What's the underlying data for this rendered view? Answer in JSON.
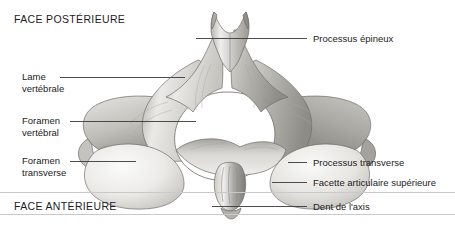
{
  "figure": {
    "type": "anatomical-diagram",
    "language": "fr",
    "orientation_labels": {
      "top": "FACE POSTÉRIEURE",
      "bottom": "FACE ANTÉRIEURE"
    },
    "callouts": [
      {
        "id": "processus-epineux",
        "label": "Processus épineux",
        "side": "right",
        "lines": [
          "Processus épineux"
        ],
        "leader": {
          "x1": 196,
          "y1": 38,
          "x2": 307,
          "y2": 38
        }
      },
      {
        "id": "lame-vertebrale",
        "label": "Lame vertébrale",
        "side": "left",
        "lines": [
          "Lame",
          "vertébrale"
        ],
        "leader": {
          "x1": 60,
          "y1": 77,
          "x2": 185,
          "y2": 77
        }
      },
      {
        "id": "foramen-vertebral",
        "label": "Foramen vertébral",
        "side": "left",
        "lines": [
          "Foramen",
          "vertébral"
        ],
        "leader": {
          "x1": 70,
          "y1": 121,
          "x2": 196,
          "y2": 121
        }
      },
      {
        "id": "foramen-transverse",
        "label": "Foramen transverse",
        "side": "left",
        "lines": [
          "Foramen",
          "transverse"
        ],
        "leader": {
          "x1": 70,
          "y1": 161,
          "x2": 136,
          "y2": 161
        }
      },
      {
        "id": "processus-transverse",
        "label": "Processus transverse",
        "side": "right",
        "lines": [
          "Processus transverse"
        ],
        "leader": {
          "x1": 288,
          "y1": 162,
          "x2": 307,
          "y2": 162
        }
      },
      {
        "id": "facette-articulaire-superieure",
        "label": "Facette articulaire supérieure",
        "side": "right",
        "lines": [
          "Facette articulaire supérieure"
        ],
        "leader": {
          "x1": 272,
          "y1": 182,
          "x2": 307,
          "y2": 182
        }
      },
      {
        "id": "dent-de-laxis",
        "label": "Dent de l'axis",
        "side": "right",
        "lines": [
          "Dent de l'axis"
        ],
        "leader": {
          "x1": 212,
          "y1": 206,
          "x2": 307,
          "y2": 206
        }
      }
    ],
    "colors": {
      "text": "#1c1c1c",
      "leader_line": "#3a3a3a",
      "divider": "#c9c9c9",
      "bone_light": "#f2f1ef",
      "bone_mid": "#d2d0cc",
      "bone_shadow": "#9d9b97",
      "bone_outline": "#6f6d69",
      "background": "#ffffff"
    }
  }
}
